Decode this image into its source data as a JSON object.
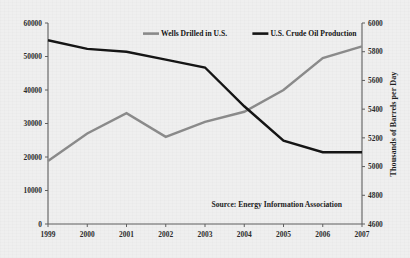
{
  "chart_data": {
    "type": "line",
    "title": "",
    "xlabel": "",
    "ylabel": "",
    "categories": [
      "1999",
      "2000",
      "2001",
      "2002",
      "2003",
      "2004",
      "2005",
      "2006",
      "2007"
    ],
    "x": [
      1999,
      2000,
      2001,
      2002,
      2003,
      2004,
      2005,
      2006,
      2007
    ],
    "grid": false,
    "legend_position": "top-center",
    "annotations": [
      "Source: Energy Information Association"
    ],
    "axes": {
      "left": {
        "label": "",
        "ylim": [
          0,
          60000
        ],
        "ticks": [
          0,
          10000,
          20000,
          30000,
          40000,
          50000,
          60000
        ],
        "tick_labels": [
          "0",
          "10000",
          "20000",
          "30000",
          "40000",
          "50000",
          "60000"
        ]
      },
      "right": {
        "label": "Thousands of Barrels per Day",
        "ylim": [
          4600,
          6000
        ],
        "ticks": [
          4600,
          4800,
          5000,
          5200,
          5400,
          5600,
          5800,
          6000
        ],
        "tick_labels": [
          "4600",
          "4800",
          "5000",
          "5200",
          "5400",
          "5600",
          "5800",
          "6000"
        ]
      },
      "x": {
        "ticks": [
          1999,
          2000,
          2001,
          2002,
          2003,
          2004,
          2005,
          2006,
          2007
        ],
        "tick_labels": [
          "1999",
          "2000",
          "2001",
          "2002",
          "2003",
          "2004",
          "2005",
          "2006",
          "2007"
        ]
      }
    },
    "series": [
      {
        "name": "Wells Drilled in U.S.",
        "axis": "left",
        "color": "#8a8a8a",
        "values": [
          18800,
          27000,
          33100,
          26000,
          30500,
          33500,
          40000,
          49500,
          53000
        ]
      },
      {
        "name": "U.S. Crude Oil Production",
        "axis": "right",
        "color": "#151515",
        "values": [
          5880,
          5820,
          5800,
          5745,
          5690,
          5420,
          5180,
          5100,
          5100
        ]
      }
    ]
  },
  "legend": {
    "items": [
      {
        "label": "Wells Drilled in U.S.",
        "color": "#8a8a8a"
      },
      {
        "label": "U.S. Crude Oil Production",
        "color": "#151515"
      }
    ]
  },
  "source": {
    "text": "Source: Energy Information Association"
  },
  "right_axis_title": {
    "text": "Thousands of Barrels per Day"
  },
  "colors": {
    "background": "#efefef",
    "axis": "#5e5e5e",
    "text": "#1c1c1c",
    "series_wells": "#8a8a8a",
    "series_crude": "#151515"
  }
}
